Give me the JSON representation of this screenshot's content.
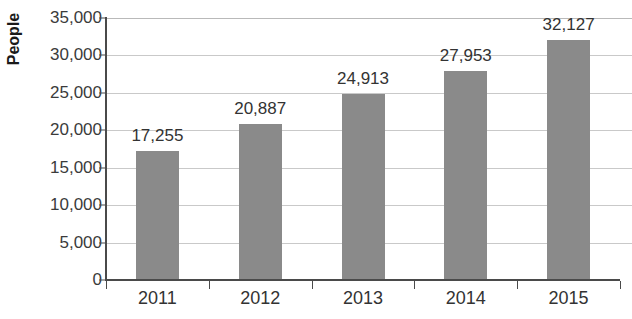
{
  "chart_data": {
    "type": "bar",
    "title": "",
    "xlabel": "",
    "ylabel": "People",
    "categories": [
      "2011",
      "2012",
      "2013",
      "2014",
      "2015"
    ],
    "values": [
      17255,
      20887,
      24913,
      27953,
      32127
    ],
    "value_labels": [
      "17,255",
      "20,887",
      "24,913",
      "27,953",
      "32,127"
    ],
    "ylim": [
      0,
      35000
    ],
    "ytick_values": [
      0,
      5000,
      10000,
      15000,
      20000,
      25000,
      30000,
      35000
    ],
    "ytick_labels": [
      "0",
      "5,000",
      "10,000",
      "15,000",
      "20,000",
      "25,000",
      "30,000",
      "35,000"
    ],
    "grid": true,
    "legend": false,
    "bar_color": "#8a8a8a",
    "gridline_color": "#c9c9c9",
    "axis_color": "#4a4a4a",
    "text_color": "#333333",
    "axis_title_color": "#1a1a1a"
  }
}
